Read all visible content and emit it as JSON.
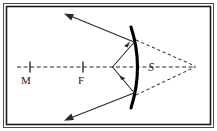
{
  "figure": {
    "background_color": "#ffffff",
    "frame": {
      "outer_border_color": "#4a4a4a",
      "inner_border_color": "#1a1a1a"
    },
    "labels": {
      "mirror_center_label": "M",
      "focal_point_label": "F",
      "source_label": "S"
    },
    "colors": {
      "ray_color": "#2b2b2b",
      "mirror_color": "#000000",
      "axis_color": "#2b2b2b",
      "virtual_ray_color": "#3a3a3a"
    },
    "geometry": {
      "axis": {
        "x1": 17,
        "y1": 67,
        "x2": 196,
        "y2": 67
      },
      "tick_m": {
        "x": 30,
        "y": 67
      },
      "tick_f": {
        "x": 83,
        "y": 67
      },
      "object_point": {
        "x": 112,
        "y": 67
      },
      "virtual_image_point": {
        "x": 195,
        "y": 66
      },
      "mirror_top": {
        "x": 131,
        "y": 27
      },
      "mirror_bottom": {
        "x": 131,
        "y": 108
      },
      "mirror_bulge_x": 142,
      "hit_upper": {
        "x": 134,
        "y": 42
      },
      "hit_lower": {
        "x": 134,
        "y": 93
      },
      "reflected_upper_end": {
        "x": 65,
        "y": 13
      },
      "reflected_lower_end": {
        "x": 65,
        "y": 120
      }
    },
    "elements": {
      "axis_name": "principal-axis",
      "mirror_name": "concave-mirror-arc",
      "incident_upper": "incident-ray-upper",
      "incident_lower": "incident-ray-lower",
      "reflected_upper": "reflected-ray-upper",
      "reflected_lower": "reflected-ray-lower",
      "virtual_upper": "virtual-ray-upper",
      "virtual_lower": "virtual-ray-lower"
    }
  }
}
